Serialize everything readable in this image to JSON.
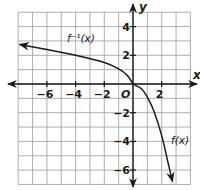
{
  "chart_data": {
    "type": "line",
    "title": "",
    "xlabel": "x",
    "ylabel": "y",
    "xlim": [
      -8,
      4
    ],
    "ylim": [
      -7,
      5
    ],
    "grid": true,
    "origin_label": "O",
    "x_ticks": [
      {
        "value": -6,
        "label": "−6"
      },
      {
        "value": -4,
        "label": "−4"
      },
      {
        "value": -2,
        "label": "−2"
      },
      {
        "value": 2,
        "label": "2"
      }
    ],
    "y_ticks": [
      {
        "value": 4,
        "label": "4"
      },
      {
        "value": 2,
        "label": "2"
      },
      {
        "value": -2,
        "label": "−2"
      },
      {
        "value": -4,
        "label": "−4"
      },
      {
        "value": -6,
        "label": "−6"
      }
    ],
    "series": [
      {
        "name": "f⁻¹(x)",
        "label_pos": [
          -4.6,
          2.9
        ],
        "points": [
          [
            -7.9,
            2.75
          ],
          [
            -6,
            2.4
          ],
          [
            -4,
            2.0
          ],
          [
            -2,
            1.5
          ],
          [
            -1,
            1.05
          ],
          [
            -0.4,
            0.6
          ],
          [
            0,
            0
          ]
        ],
        "arrow": "start"
      },
      {
        "name": "f(x)",
        "label_pos": [
          2.65,
          -4.2
        ],
        "points": [
          [
            0,
            0
          ],
          [
            0.6,
            -0.35
          ],
          [
            1.05,
            -1.0
          ],
          [
            1.5,
            -2.0
          ],
          [
            2.0,
            -3.6
          ],
          [
            2.4,
            -5.3
          ],
          [
            2.75,
            -6.8
          ]
        ],
        "arrow": "end"
      }
    ]
  }
}
